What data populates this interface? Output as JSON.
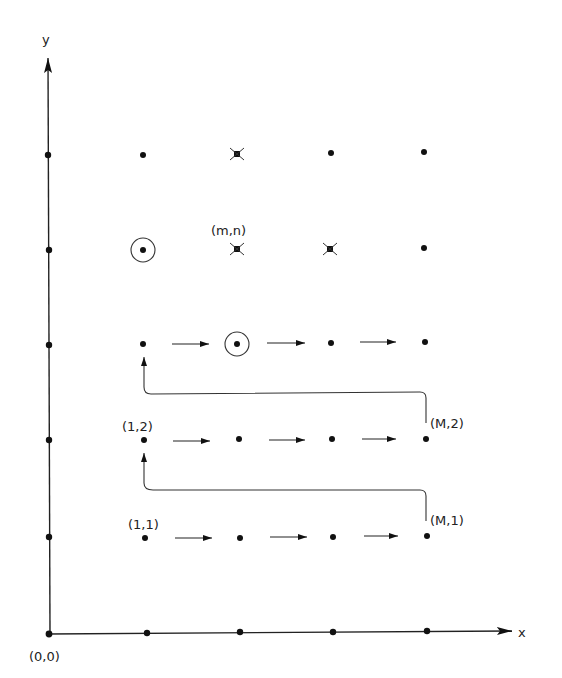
{
  "axes": {
    "x_label": "x",
    "y_label": "y",
    "origin_label": "(0,0)"
  },
  "labels": {
    "mn": "(m,n)",
    "one_two": "(1,2)",
    "M_two": "(M,2)",
    "one_one": "(1,1)",
    "M_one": "(M,1)"
  },
  "grid": {
    "columns_x": [
      145,
      239,
      332,
      427
    ],
    "rows_y": [
      155,
      250,
      345,
      440,
      537
    ],
    "axis_ticks_x": [
      147,
      240,
      333,
      427
    ],
    "axis_ticks_y": [
      155,
      250,
      345,
      440,
      537
    ]
  },
  "special_points": {
    "circled": [
      [
        145,
        250
      ],
      [
        237,
        345
      ]
    ],
    "crossed": [
      [
        237,
        155
      ],
      [
        237,
        250
      ],
      [
        331,
        250
      ]
    ]
  },
  "colors": {
    "ink": "#111111",
    "background": "#ffffff"
  }
}
